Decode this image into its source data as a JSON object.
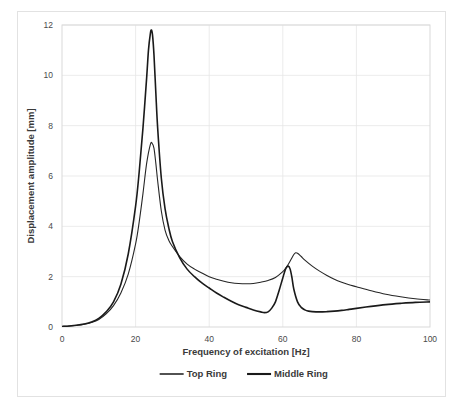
{
  "chart_data": {
    "type": "line",
    "title": "",
    "xlabel": "Frequency of excitation [Hz]",
    "ylabel": "Displacement amplitude [mm]",
    "xlim": [
      0,
      100
    ],
    "ylim": [
      0,
      12
    ],
    "xticks": [
      0,
      20,
      40,
      60,
      80,
      100
    ],
    "yticks": [
      0,
      2,
      4,
      6,
      8,
      10,
      12
    ],
    "grid": true,
    "legend_position": "bottom-center",
    "series": [
      {
        "name": "Top Ring",
        "color": "#262626",
        "linewidth": 1.1,
        "x": [
          0,
          2,
          4,
          6,
          8,
          10,
          12,
          14,
          16,
          18,
          20,
          21,
          22,
          23,
          24,
          24.5,
          25,
          25.5,
          26,
          27,
          28,
          29,
          30,
          32,
          34,
          36,
          38,
          40,
          42,
          44,
          46,
          48,
          50,
          52,
          54,
          56,
          58,
          60,
          61,
          62,
          63,
          63.5,
          64,
          65,
          66,
          68,
          70,
          72,
          74,
          76,
          78,
          80,
          84,
          88,
          92,
          96,
          100
        ],
        "y": [
          0.02,
          0.04,
          0.07,
          0.11,
          0.18,
          0.3,
          0.52,
          0.85,
          1.35,
          2.1,
          3.3,
          4.2,
          5.3,
          6.5,
          7.25,
          7.3,
          7.1,
          6.5,
          5.8,
          4.6,
          3.85,
          3.45,
          3.2,
          2.8,
          2.5,
          2.3,
          2.15,
          2.0,
          1.9,
          1.82,
          1.76,
          1.73,
          1.72,
          1.73,
          1.78,
          1.85,
          1.97,
          2.2,
          2.38,
          2.62,
          2.88,
          2.95,
          2.93,
          2.8,
          2.66,
          2.42,
          2.22,
          2.05,
          1.9,
          1.78,
          1.68,
          1.6,
          1.44,
          1.3,
          1.2,
          1.12,
          1.07
        ]
      },
      {
        "name": "Middle Ring",
        "color": "#1a1a1a",
        "linewidth": 1.6,
        "x": [
          0,
          2,
          4,
          6,
          8,
          10,
          12,
          14,
          16,
          18,
          20,
          21,
          22,
          23,
          23.5,
          24,
          24.3,
          24.6,
          25,
          25.5,
          26,
          27,
          28,
          29,
          30,
          32,
          34,
          36,
          38,
          40,
          42,
          44,
          46,
          48,
          50,
          52,
          54,
          55,
          56,
          57,
          58,
          59,
          60,
          60.8,
          61.5,
          62,
          62.5,
          63,
          64,
          65,
          66,
          67,
          68,
          70,
          72,
          74,
          76,
          78,
          80,
          84,
          88,
          92,
          96,
          100
        ],
        "y": [
          0.02,
          0.04,
          0.07,
          0.12,
          0.2,
          0.34,
          0.6,
          1.0,
          1.7,
          2.9,
          4.8,
          6.2,
          7.9,
          9.9,
          11.0,
          11.65,
          11.8,
          11.6,
          10.8,
          9.3,
          7.9,
          5.9,
          4.7,
          3.95,
          3.4,
          2.75,
          2.3,
          2.0,
          1.75,
          1.55,
          1.35,
          1.18,
          1.02,
          0.88,
          0.78,
          0.68,
          0.6,
          0.57,
          0.6,
          0.75,
          1.0,
          1.45,
          1.95,
          2.32,
          2.42,
          2.3,
          1.95,
          1.5,
          1.0,
          0.78,
          0.68,
          0.63,
          0.61,
          0.6,
          0.61,
          0.63,
          0.66,
          0.7,
          0.74,
          0.82,
          0.89,
          0.94,
          0.98,
          1.0
        ]
      }
    ]
  },
  "legend": {
    "items": [
      {
        "label": "Top Ring"
      },
      {
        "label": "Middle Ring"
      }
    ]
  }
}
